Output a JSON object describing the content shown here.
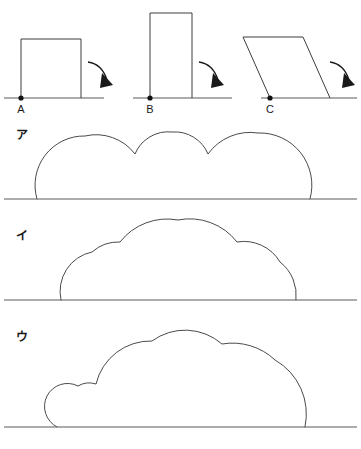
{
  "page": {
    "width": 361,
    "height": 449,
    "background_color": "#ffffff",
    "ink_color": "#3c3c3c"
  },
  "top_row": {
    "ground_lines": [
      {
        "name": "ground-a",
        "x1": 4,
        "x2": 104,
        "y": 98
      },
      {
        "name": "ground-b",
        "x1": 133,
        "x2": 232,
        "y": 98
      },
      {
        "name": "ground-c",
        "x1": 261,
        "x2": 357,
        "y": 98
      }
    ],
    "shapes": [
      {
        "id": "A",
        "label": "A",
        "type": "square",
        "label_x": 21,
        "label_y": 113,
        "pivot": {
          "x": 21,
          "y": 98
        },
        "points": "21,98 21,39 81,39 81,98",
        "side_length_px": 60,
        "arrow": {
          "path": "M 88 62 Q 102 64 107 80",
          "head": "104,74 113,86 100,87"
        }
      },
      {
        "id": "B",
        "label": "B",
        "type": "rectangle",
        "label_x": 150,
        "label_y": 113,
        "pivot": {
          "x": 150,
          "y": 98
        },
        "points": "150,98 150,13 192,13 192,98",
        "width_px": 42,
        "height_px": 85,
        "arrow": {
          "path": "M 199 62 Q 213 64 218 80",
          "head": "215,74 224,86 211,87"
        }
      },
      {
        "id": "C",
        "label": "C",
        "type": "parallelogram",
        "label_x": 270,
        "label_y": 113,
        "pivot": {
          "x": 270,
          "y": 98
        },
        "points": "270,98 243,37 303,37 330,98",
        "arrow": {
          "path": "M 330 62 Q 344 64 349 80",
          "head": "346,74 355,86 342,87"
        }
      }
    ]
  },
  "answer_choices": [
    {
      "id": "ア",
      "label": "ア",
      "label_x": 22,
      "label_y": 139,
      "description": "three arcs of nearly equal height forming a scalloped dome",
      "baseline": {
        "x1": 4,
        "x2": 357,
        "y": 199
      },
      "curve_start_x": 37,
      "curve_end_x": 310,
      "cusps_x": [
        135,
        208
      ],
      "peak_y": 131,
      "path": "M 37 199 A 49 49 0 0 1 85 136 A 49 49 0 0 1 135 154 A 36 36 0 0 1 172 132 A 36 36 0 0 1 208 154 A 52 52 0 0 1 258 133 A 52 52 0 0 1 310 199"
    },
    {
      "id": "イ",
      "label": "イ",
      "label_x": 22,
      "label_y": 240,
      "description": "tall central arc with lower arcs at each side",
      "baseline": {
        "x1": 4,
        "x2": 357,
        "y": 300
      },
      "curve_start_x": 61,
      "curve_end_x": 296,
      "cusps_x": [
        120,
        237
      ],
      "peak_y": 220,
      "path": "M 61 300 A 40 40 0 0 1 92 252 A 40 40 0 0 1 120 242 A 60 60 0 0 1 178 220 A 60 60 0 0 1 237 242 A 42 42 0 0 1 280 262 A 42 42 0 0 1 296 300"
    },
    {
      "id": "ウ",
      "label": "ウ",
      "label_x": 22,
      "label_y": 341,
      "description": "small arc on left, tall arc in middle, medium arc falling to the right",
      "baseline": {
        "x1": 4,
        "x2": 357,
        "y": 427
      },
      "curve_start_x": 57,
      "curve_end_x": 305,
      "cusps_x": [
        96,
        222
      ],
      "peak_y": 330,
      "path": "M 57 427 A 22 22 0 0 1 78 386 A 22 22 0 0 1 96 384 A 56 56 0 0 1 152 341 A 56 56 0 0 1 222 344 A 62 62 0 0 1 275 360 A 62 62 0 0 1 305 427"
    }
  ]
}
